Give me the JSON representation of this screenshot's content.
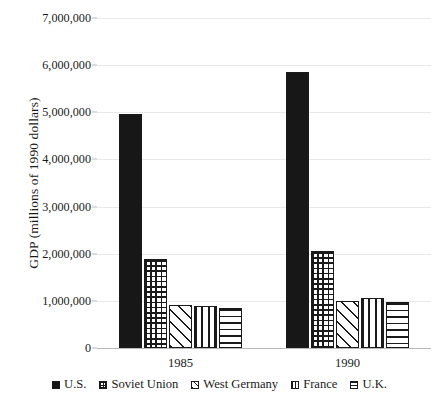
{
  "chart_data": {
    "type": "bar",
    "title": "",
    "xlabel": "",
    "ylabel": "GDP (millions of 1990 dollars)",
    "categories": [
      "1985",
      "1990"
    ],
    "series": [
      {
        "name": "U.S.",
        "pattern": "solid",
        "values": [
          4960000,
          5850000
        ]
      },
      {
        "name": "Soviet Union",
        "pattern": "grid",
        "values": [
          1890000,
          2050000
        ]
      },
      {
        "name": "West Germany",
        "pattern": "diagonal",
        "values": [
          920000,
          1000000
        ]
      },
      {
        "name": "France",
        "pattern": "vertical",
        "values": [
          900000,
          1070000
        ]
      },
      {
        "name": "U.K.",
        "pattern": "horizontal",
        "values": [
          850000,
          980000
        ]
      }
    ],
    "ylim": [
      0,
      7000000
    ],
    "ytick_step": 1000000,
    "ytick_labels": [
      "0",
      "1,000,000",
      "2,000,000",
      "3,000,000",
      "4,000,000",
      "5,000,000",
      "6,000,000",
      "7,000,000"
    ],
    "ytick_values": [
      0,
      1000000,
      2000000,
      3000000,
      4000000,
      5000000,
      6000000,
      7000000
    ],
    "grid": true,
    "legend_position": "bottom",
    "colors": {
      "ink": "#1a1a1a",
      "gridline": "#e9e9ec",
      "axis": "#b9b9bd",
      "background": "#ffffff"
    }
  }
}
